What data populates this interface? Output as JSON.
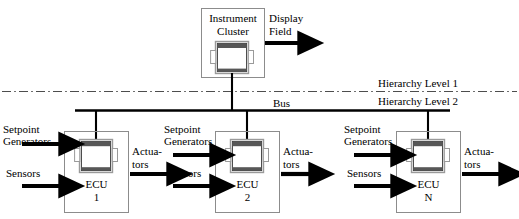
{
  "diagram": {
    "title_text_present": false,
    "hierarchy": {
      "level1_label": "Hierarchy Level 1",
      "level2_label": "Hierarchy Level 2",
      "divider_style": "dash-dot"
    },
    "bus": {
      "label": "Bus"
    },
    "instrument_cluster": {
      "line1": "Instrument",
      "line2": "Cluster",
      "output": {
        "line1": "Display",
        "line2": "Field"
      }
    },
    "ecus": [
      {
        "name_line1": "ECU",
        "name_line2": "1",
        "inputs": [
          {
            "line1": "Setpoint",
            "line2": "Generators"
          },
          {
            "line1": "Sensors",
            "line2": ""
          }
        ],
        "output": {
          "line1": "Actua-",
          "line2": "tors"
        }
      },
      {
        "name_line1": "ECU",
        "name_line2": "2",
        "inputs": [
          {
            "line1": "Setpoint",
            "line2": "Generators"
          },
          {
            "line1": "Sensors",
            "line2": ""
          }
        ],
        "output": {
          "line1": "Actua-",
          "line2": "tors"
        }
      },
      {
        "name_line1": "ECU",
        "name_line2": "N",
        "inputs": [
          {
            "line1": "Setpoint",
            "line2": "Generators"
          },
          {
            "line1": "Sensors",
            "line2": ""
          }
        ],
        "output": {
          "line1": "Actua-",
          "line2": "tors"
        }
      }
    ],
    "continuation_marker": "...",
    "colors": {
      "line": "#000000",
      "box_border": "#8c8c8c",
      "device_body": "#ffffff",
      "device_frame": "#9a9a9a",
      "device_bar": "#555555"
    }
  }
}
